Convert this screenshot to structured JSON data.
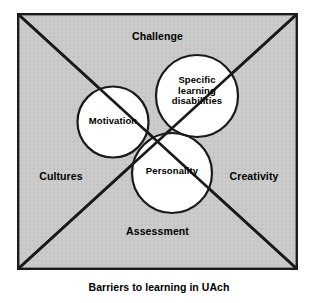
{
  "figure": {
    "caption": "Barriers to learning in UAch",
    "background_color": "#ffffff",
    "square_fill": "#c9c9c9",
    "circle_fill": "#ffffff",
    "stroke_color": "#000000"
  },
  "diagram": {
    "type": "venn-in-quadrants",
    "quadrant_labels": [
      {
        "id": "top",
        "text": "Challenge"
      },
      {
        "id": "left",
        "text": "Cultures"
      },
      {
        "id": "right",
        "text": "Creativity"
      },
      {
        "id": "bottom",
        "text": "Assessment"
      }
    ],
    "circles": [
      {
        "id": "motivation",
        "text": "Motivation"
      },
      {
        "id": "sld",
        "text": "Specific\nlearning\ndisabilities"
      },
      {
        "id": "personality",
        "text": "Personality"
      }
    ]
  }
}
